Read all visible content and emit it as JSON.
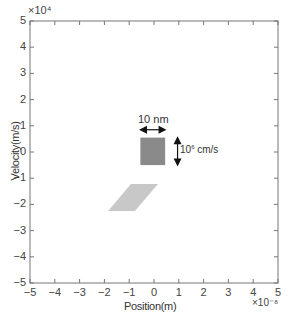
{
  "chart_data": {
    "type": "scatter",
    "title": "",
    "xlabel": "Position(m)",
    "ylabel": "Velocity(m/s)",
    "x_multiplier": "×10⁻⁸",
    "y_multiplier": "×10⁴",
    "xlim": [
      -5,
      5
    ],
    "ylim": [
      -5,
      5
    ],
    "x_ticks": [
      "−5",
      "−4",
      "−3",
      "−2",
      "−1",
      "0",
      "1",
      "2",
      "3",
      "4",
      "5"
    ],
    "y_ticks": [
      "5",
      "4",
      "3",
      "2",
      "1",
      "0",
      "−1",
      "−2",
      "−3",
      "−4",
      "−5"
    ],
    "grid": false,
    "series": [
      {
        "name": "initial distribution (dark square)",
        "shape": "square",
        "color": "#8a8a8a",
        "vertices": [
          [
            -0.55,
            0.55
          ],
          [
            0.45,
            0.55
          ],
          [
            0.45,
            -0.5
          ],
          [
            -0.55,
            -0.5
          ]
        ]
      },
      {
        "name": "evolved distribution (light parallelogram)",
        "shape": "parallelogram",
        "color": "#c8c8c8",
        "vertices": [
          [
            -0.93,
            -1.22
          ],
          [
            0.16,
            -1.22
          ],
          [
            -0.77,
            -2.25
          ],
          [
            -1.85,
            -2.25
          ]
        ]
      }
    ],
    "annotations": [
      {
        "text": "10 nm",
        "type": "horizontal-double-arrow",
        "span_x": [
          -0.55,
          0.45
        ],
        "y": 0.85
      },
      {
        "text_base": "10",
        "text_sup": "6",
        "text_unit": " cm/s",
        "type": "vertical-double-arrow",
        "x": 0.95,
        "span_y": [
          0.55,
          -0.5
        ]
      }
    ]
  }
}
